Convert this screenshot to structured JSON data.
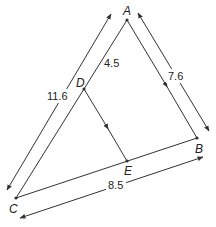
{
  "diagram": {
    "type": "triangle-with-parallel-segment",
    "points": {
      "A": {
        "label": "A",
        "x": 127,
        "y": 20
      },
      "B": {
        "label": "B",
        "x": 197,
        "y": 138
      },
      "C": {
        "label": "C",
        "x": 16,
        "y": 198
      },
      "D": {
        "label": "D",
        "x": 84,
        "y": 89
      },
      "E": {
        "label": "E",
        "x": 127,
        "y": 161
      }
    },
    "measurements": {
      "AC": "11.6",
      "AD": "4.5",
      "AB": "7.6",
      "CB": "8.5"
    },
    "parallel_segments": [
      "AB",
      "DE"
    ],
    "colors": {
      "line": "#333333",
      "background": "#ffffff"
    }
  }
}
